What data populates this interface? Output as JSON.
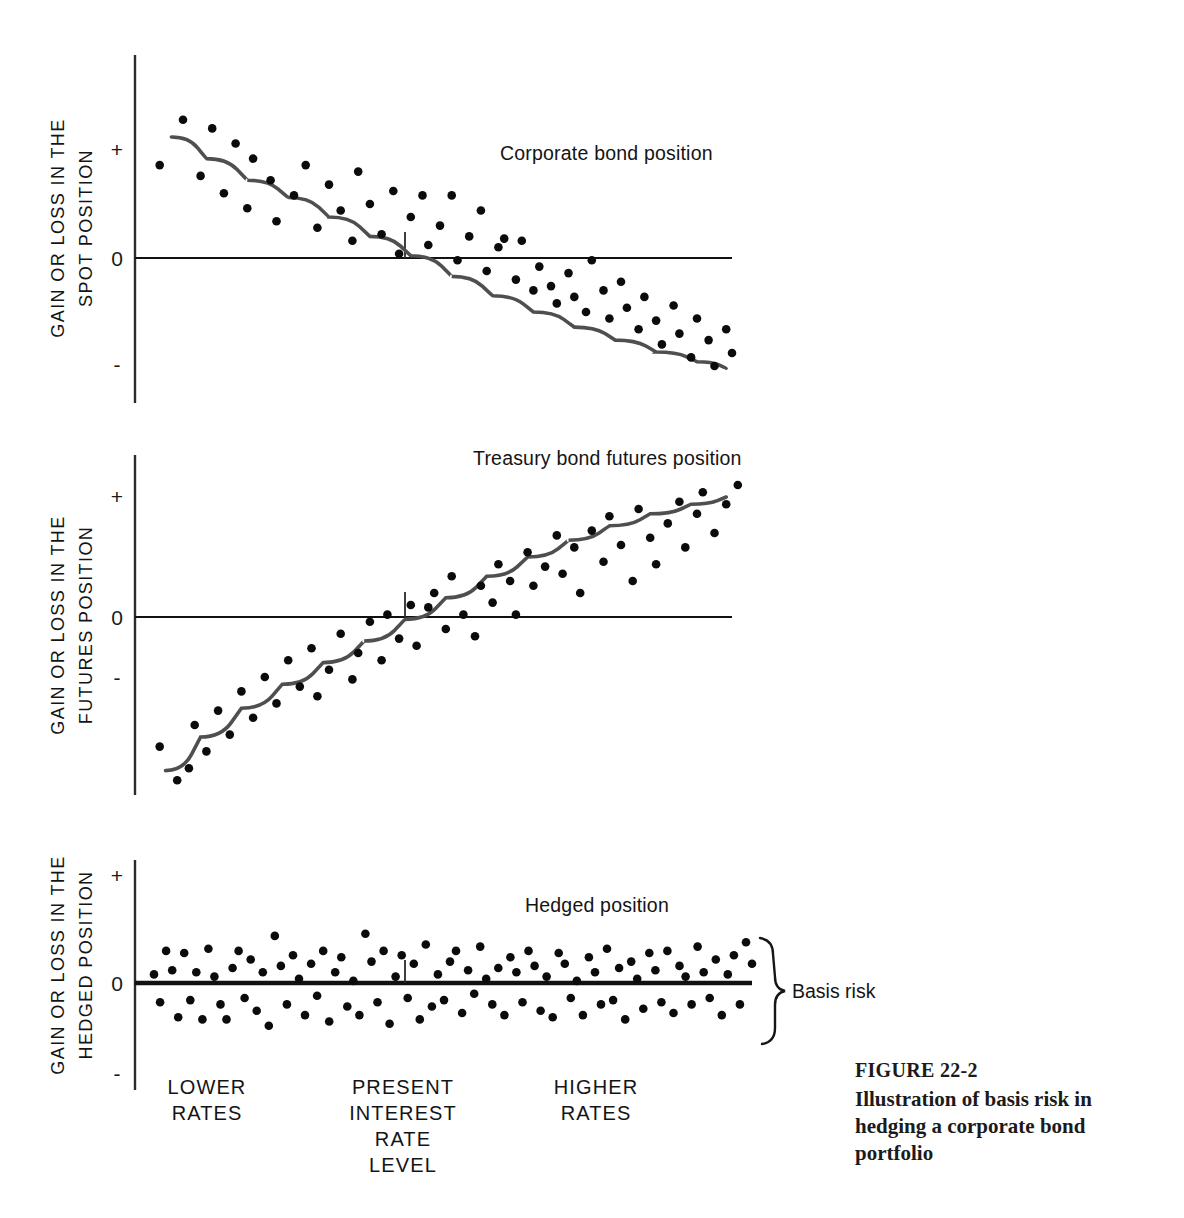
{
  "figure": {
    "number_label": "FIGURE 22-2",
    "caption": "Illustration of basis risk in hedging a corporate bond portfolio"
  },
  "annotations": {
    "brace_label": "Basis risk"
  },
  "category_labels": [
    {
      "id": "lower",
      "lines": [
        "LOWER",
        "RATES"
      ],
      "x": 207
    },
    {
      "id": "present",
      "lines": [
        "PRESENT",
        "INTEREST",
        "RATE",
        "LEVEL"
      ],
      "x": 403
    },
    {
      "id": "higher",
      "lines": [
        "HIGHER",
        "RATES"
      ],
      "x": 596
    }
  ],
  "chart_data": [
    {
      "id": "corporate-bond-position",
      "type": "scatter",
      "title": "Corporate bond position",
      "ylabel": [
        "GAIN OR LOSS IN THE",
        "SPOT POSITION"
      ],
      "xlabel": "PRESENT INTEREST RATE LEVEL",
      "tick_labels": [
        "+",
        "0",
        "-"
      ],
      "ylim": [
        -1.45,
        1.45
      ],
      "xlim": [
        0,
        100
      ],
      "grid": false,
      "legend": "none",
      "zero_line": true,
      "curve_style": "decreasing-sigmoid",
      "curve": [
        [
          4,
          1.12
        ],
        [
          10,
          0.92
        ],
        [
          17,
          0.72
        ],
        [
          24,
          0.56
        ],
        [
          31,
          0.38
        ],
        [
          38,
          0.2
        ],
        [
          45,
          0.02
        ],
        [
          52,
          -0.17
        ],
        [
          59,
          -0.35
        ],
        [
          66,
          -0.5
        ],
        [
          73,
          -0.64
        ],
        [
          80,
          -0.76
        ],
        [
          87,
          -0.87
        ],
        [
          94,
          -0.96
        ],
        [
          99,
          -1.02
        ]
      ],
      "points": [
        [
          6,
          1.28
        ],
        [
          2,
          0.86
        ],
        [
          9,
          0.76
        ],
        [
          11,
          1.2
        ],
        [
          13,
          0.6
        ],
        [
          15,
          1.06
        ],
        [
          17,
          0.46
        ],
        [
          18,
          0.92
        ],
        [
          21,
          0.72
        ],
        [
          22,
          0.34
        ],
        [
          25,
          0.58
        ],
        [
          27,
          0.86
        ],
        [
          29,
          0.28
        ],
        [
          31,
          0.68
        ],
        [
          33,
          0.44
        ],
        [
          35,
          0.16
        ],
        [
          36,
          0.8
        ],
        [
          38,
          0.5
        ],
        [
          40,
          0.22
        ],
        [
          42,
          0.62
        ],
        [
          43,
          0.04
        ],
        [
          45,
          0.38
        ],
        [
          47,
          0.58
        ],
        [
          48,
          0.12
        ],
        [
          50,
          0.3
        ],
        [
          52,
          0.58
        ],
        [
          53,
          -0.02
        ],
        [
          55,
          0.2
        ],
        [
          57,
          0.44
        ],
        [
          58,
          -0.12
        ],
        [
          60,
          0.1
        ],
        [
          61,
          0.18
        ],
        [
          63,
          -0.2
        ],
        [
          64,
          0.16
        ],
        [
          66,
          -0.3
        ],
        [
          67,
          -0.08
        ],
        [
          69,
          -0.26
        ],
        [
          70,
          -0.42
        ],
        [
          72,
          -0.14
        ],
        [
          73,
          -0.36
        ],
        [
          75,
          -0.5
        ],
        [
          76,
          -0.02
        ],
        [
          78,
          -0.3
        ],
        [
          79,
          -0.56
        ],
        [
          81,
          -0.22
        ],
        [
          82,
          -0.46
        ],
        [
          84,
          -0.66
        ],
        [
          85,
          -0.36
        ],
        [
          87,
          -0.58
        ],
        [
          88,
          -0.8
        ],
        [
          90,
          -0.44
        ],
        [
          91,
          -0.7
        ],
        [
          93,
          -0.92
        ],
        [
          94,
          -0.56
        ],
        [
          96,
          -0.76
        ],
        [
          97,
          -1.0
        ],
        [
          99,
          -0.66
        ],
        [
          100,
          -0.88
        ],
        [
          102,
          -1.06
        ],
        [
          104,
          -0.78
        ],
        [
          106,
          -1.0
        ]
      ]
    },
    {
      "id": "treasury-bond-futures-position",
      "type": "scatter",
      "title": "Treasury bond futures position",
      "ylabel": [
        "GAIN OR LOSS IN THE",
        "FUTURES POSITION"
      ],
      "xlabel": "PRESENT INTEREST RATE LEVEL",
      "tick_labels": [
        "+",
        "0",
        "-"
      ],
      "ylim": [
        -1.45,
        1.45
      ],
      "xlim": [
        0,
        100
      ],
      "grid": false,
      "legend": "none",
      "zero_line": true,
      "curve_style": "increasing-sigmoid",
      "curve": [
        [
          3,
          -1.28
        ],
        [
          9,
          -1.0
        ],
        [
          16,
          -0.76
        ],
        [
          23,
          -0.56
        ],
        [
          30,
          -0.38
        ],
        [
          37,
          -0.2
        ],
        [
          44,
          -0.02
        ],
        [
          51,
          0.16
        ],
        [
          58,
          0.34
        ],
        [
          65,
          0.5
        ],
        [
          72,
          0.64
        ],
        [
          79,
          0.76
        ],
        [
          86,
          0.86
        ],
        [
          93,
          0.94
        ],
        [
          99,
          1.0
        ]
      ],
      "points": [
        [
          2,
          -1.08
        ],
        [
          5,
          -1.36
        ],
        [
          7,
          -1.26
        ],
        [
          8,
          -0.9
        ],
        [
          10,
          -1.12
        ],
        [
          12,
          -0.78
        ],
        [
          14,
          -0.98
        ],
        [
          16,
          -0.62
        ],
        [
          18,
          -0.84
        ],
        [
          20,
          -0.5
        ],
        [
          22,
          -0.72
        ],
        [
          24,
          -0.36
        ],
        [
          26,
          -0.58
        ],
        [
          28,
          -0.26
        ],
        [
          29,
          -0.66
        ],
        [
          31,
          -0.44
        ],
        [
          33,
          -0.14
        ],
        [
          35,
          -0.52
        ],
        [
          36,
          -0.3
        ],
        [
          38,
          -0.04
        ],
        [
          40,
          -0.36
        ],
        [
          41,
          0.02
        ],
        [
          43,
          -0.18
        ],
        [
          45,
          0.1
        ],
        [
          46,
          -0.24
        ],
        [
          48,
          0.08
        ],
        [
          49,
          0.2
        ],
        [
          51,
          -0.1
        ],
        [
          52,
          0.34
        ],
        [
          54,
          0.02
        ],
        [
          56,
          -0.16
        ],
        [
          57,
          0.26
        ],
        [
          59,
          0.12
        ],
        [
          60,
          0.44
        ],
        [
          62,
          0.3
        ],
        [
          63,
          0.02
        ],
        [
          65,
          0.54
        ],
        [
          66,
          0.26
        ],
        [
          68,
          0.42
        ],
        [
          70,
          0.68
        ],
        [
          71,
          0.36
        ],
        [
          73,
          0.58
        ],
        [
          74,
          0.2
        ],
        [
          76,
          0.72
        ],
        [
          78,
          0.46
        ],
        [
          79,
          0.84
        ],
        [
          81,
          0.6
        ],
        [
          83,
          0.3
        ],
        [
          84,
          0.9
        ],
        [
          86,
          0.66
        ],
        [
          87,
          0.44
        ],
        [
          89,
          0.78
        ],
        [
          91,
          0.96
        ],
        [
          92,
          0.58
        ],
        [
          94,
          0.86
        ],
        [
          95,
          1.04
        ],
        [
          97,
          0.7
        ],
        [
          99,
          0.94
        ],
        [
          101,
          1.1
        ],
        [
          103,
          0.84
        ]
      ]
    },
    {
      "id": "hedged-position",
      "type": "scatter",
      "title": "Hedged position",
      "ylabel": [
        "GAIN OR LOSS IN THE",
        "HEDGED POSITION"
      ],
      "xlabel": "PRESENT INTEREST RATE LEVEL",
      "tick_labels": [
        "+",
        "0",
        "-"
      ],
      "ylim": [
        -1.45,
        1.45
      ],
      "xlim": [
        0,
        100
      ],
      "grid": false,
      "legend": "none",
      "zero_line": true,
      "curve_style": "flat",
      "curve": [
        [
          0,
          0
        ],
        [
          100,
          0
        ]
      ],
      "points": [
        [
          1,
          0.08
        ],
        [
          2,
          -0.18
        ],
        [
          3,
          0.3
        ],
        [
          4,
          0.12
        ],
        [
          5,
          -0.32
        ],
        [
          6,
          0.28
        ],
        [
          7,
          -0.16
        ],
        [
          8,
          0.1
        ],
        [
          9,
          -0.34
        ],
        [
          10,
          0.32
        ],
        [
          11,
          0.06
        ],
        [
          12,
          -0.2
        ],
        [
          13,
          -0.34
        ],
        [
          14,
          0.14
        ],
        [
          15,
          0.3
        ],
        [
          16,
          -0.14
        ],
        [
          17,
          0.22
        ],
        [
          18,
          -0.26
        ],
        [
          19,
          0.1
        ],
        [
          20,
          -0.4
        ],
        [
          21,
          0.44
        ],
        [
          22,
          0.16
        ],
        [
          23,
          -0.2
        ],
        [
          24,
          0.26
        ],
        [
          25,
          0.04
        ],
        [
          26,
          -0.3
        ],
        [
          27,
          0.18
        ],
        [
          28,
          -0.12
        ],
        [
          29,
          0.3
        ],
        [
          30,
          -0.36
        ],
        [
          31,
          0.1
        ],
        [
          32,
          0.24
        ],
        [
          33,
          -0.22
        ],
        [
          34,
          0.02
        ],
        [
          35,
          -0.3
        ],
        [
          36,
          0.46
        ],
        [
          37,
          0.2
        ],
        [
          38,
          -0.18
        ],
        [
          39,
          0.3
        ],
        [
          40,
          -0.38
        ],
        [
          41,
          0.06
        ],
        [
          42,
          0.26
        ],
        [
          43,
          -0.14
        ],
        [
          44,
          0.18
        ],
        [
          45,
          -0.34
        ],
        [
          46,
          0.36
        ],
        [
          47,
          -0.22
        ],
        [
          48,
          0.08
        ],
        [
          49,
          -0.16
        ],
        [
          50,
          0.2
        ],
        [
          51,
          0.3
        ],
        [
          52,
          -0.28
        ],
        [
          53,
          0.12
        ],
        [
          54,
          -0.1
        ],
        [
          55,
          0.34
        ],
        [
          56,
          0.04
        ],
        [
          57,
          -0.2
        ],
        [
          58,
          0.14
        ],
        [
          59,
          -0.3
        ],
        [
          60,
          0.24
        ],
        [
          61,
          0.1
        ],
        [
          62,
          -0.18
        ],
        [
          63,
          0.3
        ],
        [
          64,
          0.16
        ],
        [
          65,
          -0.26
        ],
        [
          66,
          0.06
        ],
        [
          67,
          -0.32
        ],
        [
          68,
          0.28
        ],
        [
          69,
          0.18
        ],
        [
          70,
          -0.14
        ],
        [
          71,
          0.02
        ],
        [
          72,
          -0.3
        ],
        [
          73,
          0.24
        ],
        [
          74,
          0.1
        ],
        [
          75,
          -0.2
        ],
        [
          76,
          0.32
        ],
        [
          77,
          -0.16
        ],
        [
          78,
          0.14
        ],
        [
          79,
          -0.34
        ],
        [
          80,
          0.2
        ],
        [
          81,
          0.04
        ],
        [
          82,
          -0.24
        ],
        [
          83,
          0.28
        ],
        [
          84,
          0.12
        ],
        [
          85,
          -0.18
        ],
        [
          86,
          0.3
        ],
        [
          87,
          -0.28
        ],
        [
          88,
          0.16
        ],
        [
          89,
          0.06
        ],
        [
          90,
          -0.2
        ],
        [
          91,
          0.34
        ],
        [
          92,
          0.1
        ],
        [
          93,
          -0.14
        ],
        [
          94,
          0.22
        ],
        [
          95,
          -0.3
        ],
        [
          96,
          0.08
        ],
        [
          97,
          0.26
        ],
        [
          98,
          -0.2
        ],
        [
          99,
          0.38
        ],
        [
          100,
          0.18
        ]
      ]
    }
  ]
}
